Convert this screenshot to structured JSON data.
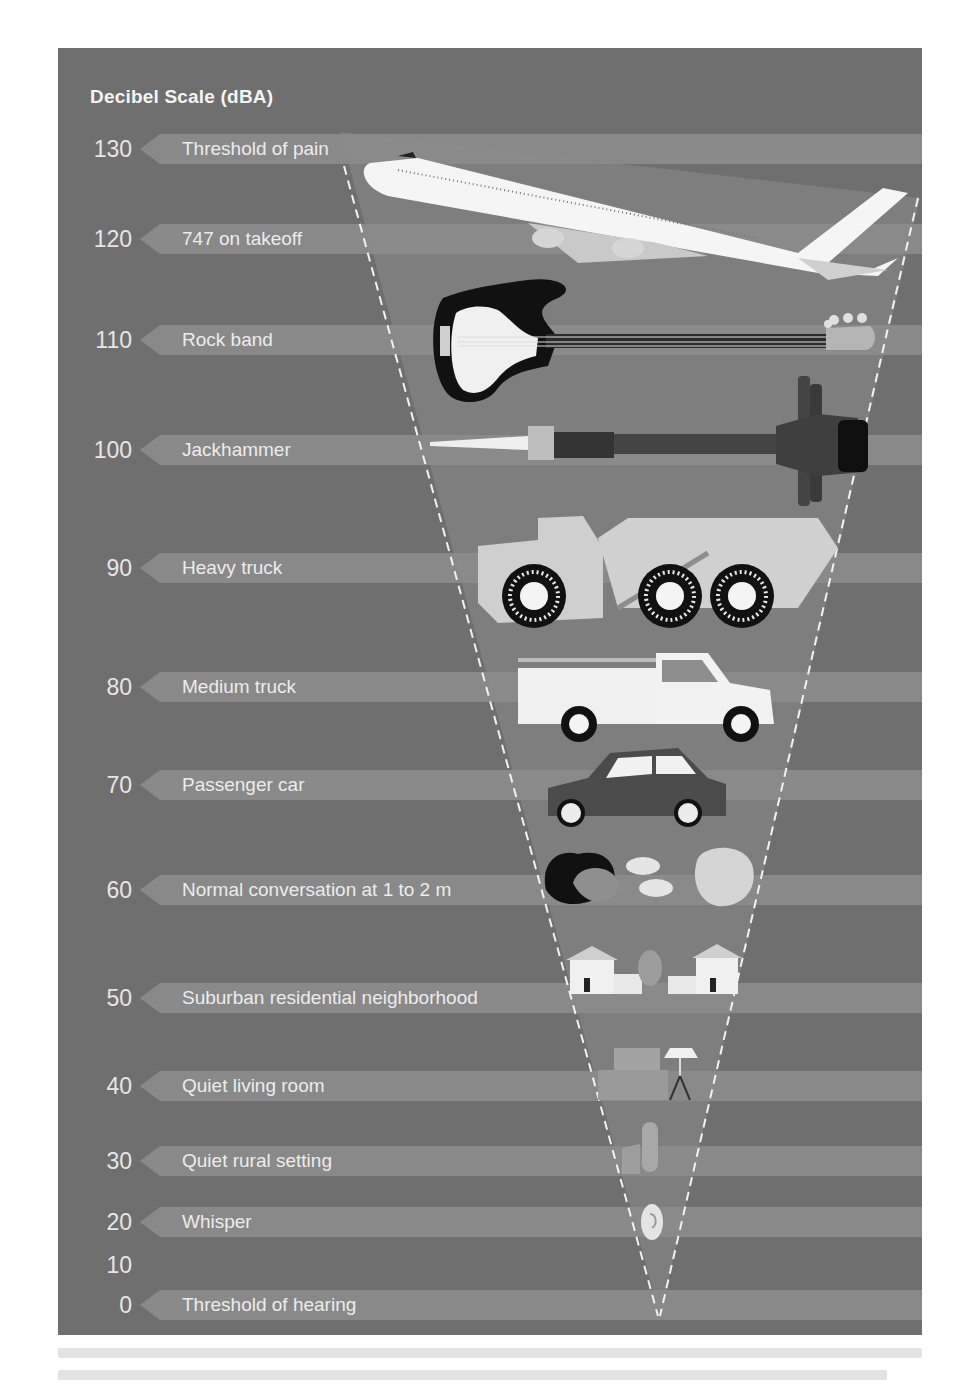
{
  "title": "Decibel Scale (dBA)",
  "colors": {
    "panel_bg": "#6f6f6f",
    "band": "#8c8c8c",
    "funnel_fill": "#858585",
    "funnel_dash": "#f2f2f2",
    "text": "#ececec"
  },
  "ticks": [
    {
      "value": "130",
      "y": 101
    },
    {
      "value": "120",
      "y": 191
    },
    {
      "value": "110",
      "y": 292
    },
    {
      "value": "100",
      "y": 402
    },
    {
      "value": "90",
      "y": 520
    },
    {
      "value": "80",
      "y": 639
    },
    {
      "value": "70",
      "y": 737
    },
    {
      "value": "60",
      "y": 842
    },
    {
      "value": "50",
      "y": 950
    },
    {
      "value": "40",
      "y": 1038
    },
    {
      "value": "30",
      "y": 1113
    },
    {
      "value": "20",
      "y": 1174
    },
    {
      "value": "10",
      "y": 1217
    },
    {
      "value": "0",
      "y": 1257
    }
  ],
  "bands": [
    {
      "db": 130,
      "label": "Threshold of pain",
      "y": 101,
      "illustration": "airplane-747"
    },
    {
      "db": 120,
      "label": "747 on takeoff",
      "y": 191,
      "illustration": "airplane-747"
    },
    {
      "db": 110,
      "label": "Rock band",
      "y": 292,
      "illustration": "bass-guitar"
    },
    {
      "db": 100,
      "label": "Jackhammer",
      "y": 402,
      "illustration": "jackhammer"
    },
    {
      "db": 90,
      "label": "Heavy truck",
      "y": 520,
      "illustration": "dump-truck"
    },
    {
      "db": 80,
      "label": "Medium truck",
      "y": 639,
      "illustration": "utility-pickup-truck"
    },
    {
      "db": 70,
      "label": "Passenger car",
      "y": 737,
      "illustration": "compact-car"
    },
    {
      "db": 60,
      "label": "Normal conversation at 1 to 2 m",
      "y": 842,
      "illustration": "two-people-talking"
    },
    {
      "db": 50,
      "label": "Suburban residential neighborhood",
      "y": 950,
      "illustration": "suburban-houses"
    },
    {
      "db": 40,
      "label": "Quiet living room",
      "y": 1038,
      "illustration": "sofa-and-lamp"
    },
    {
      "db": 30,
      "label": "Quiet rural setting",
      "y": 1113,
      "illustration": "farm-silo"
    },
    {
      "db": 20,
      "label": "Whisper",
      "y": 1174,
      "illustration": "ear"
    },
    {
      "db": 0,
      "label": "Threshold of hearing",
      "y": 1257,
      "illustration": "none"
    }
  ],
  "chart_data": {
    "type": "table",
    "title": "Decibel Scale (dBA)",
    "xlabel": "",
    "ylabel": "dBA",
    "ylim": [
      0,
      130
    ],
    "tick_labels": [
      "130",
      "120",
      "110",
      "100",
      "90",
      "80",
      "70",
      "60",
      "50",
      "40",
      "30",
      "20",
      "10",
      "0"
    ],
    "categories": [
      "Threshold of pain",
      "747 on takeoff",
      "Rock band",
      "Jackhammer",
      "Heavy truck",
      "Medium truck",
      "Passenger car",
      "Normal conversation at 1 to 2 m",
      "Suburban residential neighborhood",
      "Quiet living room",
      "Quiet rural setting",
      "Whisper",
      "Threshold of hearing"
    ],
    "values": [
      130,
      120,
      110,
      100,
      90,
      80,
      70,
      60,
      50,
      40,
      30,
      20,
      0
    ],
    "grid": false,
    "legend": "none",
    "annotations": [
      "Inverted dashed triangle (funnel) narrowing from 130 dB to 0 dB containing illustrations of each sound source"
    ]
  }
}
